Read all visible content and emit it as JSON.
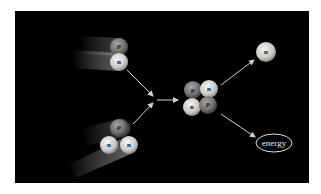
{
  "diagram": {
    "type": "nuclear-fusion",
    "background": "#000000",
    "reactants": [
      {
        "name": "deuterium",
        "particles": [
          {
            "label": "p"
          },
          {
            "label": "n"
          }
        ]
      },
      {
        "name": "tritium",
        "particles": [
          {
            "label": "p"
          },
          {
            "label": "n"
          },
          {
            "label": "n"
          }
        ]
      }
    ],
    "product_nucleus": {
      "particles": [
        {
          "label": "p"
        },
        {
          "label": "n"
        },
        {
          "label": "n"
        },
        {
          "label": "p"
        }
      ]
    },
    "free_neutron": {
      "label": "n"
    },
    "energy": {
      "label": "energy"
    },
    "colors": {
      "proton": "#7a7a7a",
      "neutron": "#d8d8d8",
      "arrow": "#d0d0d0",
      "ellipse": "#e0e0e0"
    }
  }
}
